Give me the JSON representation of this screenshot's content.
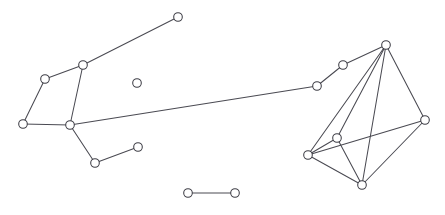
{
  "canvas": {
    "width": 445,
    "height": 215,
    "background": "#ffffff"
  },
  "style": {
    "edge_color": "#4a4a52",
    "edge_width": 1.05,
    "node_fill": "#ffffff",
    "node_stroke": "#3c3c44",
    "node_stroke_width": 1.05,
    "node_radius": 4.3
  },
  "chart_data": {
    "type": "scatter",
    "title": "",
    "subtitle": "",
    "xlabel": "",
    "ylabel": "",
    "grid": false,
    "legend": "none",
    "axes_visible": false,
    "tick_labels": [],
    "annotations": [],
    "xlim": [
      0,
      445
    ],
    "ylim": [
      0,
      215
    ],
    "node_count": 17,
    "edge_count": 26,
    "component_count": 3,
    "nodes": [
      {
        "id": "n0",
        "label": "",
        "x": 178,
        "y": 17,
        "degree": 1,
        "group": "left-cluster"
      },
      {
        "id": "n1",
        "label": "",
        "x": 83,
        "y": 65,
        "degree": 3,
        "group": "left-cluster"
      },
      {
        "id": "n2",
        "label": "",
        "x": 45,
        "y": 79,
        "degree": 2,
        "group": "left-cluster"
      },
      {
        "id": "n3",
        "label": "",
        "x": 23,
        "y": 124,
        "degree": 2,
        "group": "left-cluster"
      },
      {
        "id": "n4",
        "label": "",
        "x": 70,
        "y": 125,
        "degree": 4,
        "group": "left-cluster"
      },
      {
        "id": "n5",
        "label": "",
        "x": 95,
        "y": 163,
        "degree": 2,
        "group": "left-cluster"
      },
      {
        "id": "n6",
        "label": "",
        "x": 138,
        "y": 147,
        "degree": 1,
        "group": "left-cluster"
      },
      {
        "id": "n7",
        "label": "",
        "x": 317,
        "y": 86,
        "degree": 2,
        "group": "bridge"
      },
      {
        "id": "n8",
        "label": "",
        "x": 343,
        "y": 65,
        "degree": 2,
        "group": "bridge"
      },
      {
        "id": "n9",
        "label": "",
        "x": 386,
        "y": 45,
        "degree": 5,
        "group": "right-cluster"
      },
      {
        "id": "n10",
        "label": "",
        "x": 425,
        "y": 120,
        "degree": 4,
        "group": "right-cluster"
      },
      {
        "id": "n11",
        "label": "",
        "x": 337,
        "y": 138,
        "degree": 4,
        "group": "right-cluster"
      },
      {
        "id": "n12",
        "label": "",
        "x": 308,
        "y": 155,
        "degree": 4,
        "group": "right-cluster"
      },
      {
        "id": "n13",
        "label": "",
        "x": 362,
        "y": 185,
        "degree": 4,
        "group": "right-cluster"
      },
      {
        "id": "n14",
        "label": "",
        "x": 137,
        "y": 83,
        "degree": 0,
        "group": "isolated-node"
      },
      {
        "id": "n15",
        "label": "",
        "x": 188,
        "y": 193,
        "degree": 1,
        "group": "isolated-pair"
      },
      {
        "id": "n16",
        "label": "",
        "x": 235,
        "y": 193,
        "degree": 1,
        "group": "isolated-pair"
      }
    ],
    "edges": [
      {
        "source": "n0",
        "target": "n1"
      },
      {
        "source": "n1",
        "target": "n2"
      },
      {
        "source": "n1",
        "target": "n4"
      },
      {
        "source": "n2",
        "target": "n3"
      },
      {
        "source": "n3",
        "target": "n4"
      },
      {
        "source": "n4",
        "target": "n5"
      },
      {
        "source": "n4",
        "target": "n7"
      },
      {
        "source": "n5",
        "target": "n6"
      },
      {
        "source": "n7",
        "target": "n8"
      },
      {
        "source": "n8",
        "target": "n9"
      },
      {
        "source": "n9",
        "target": "n10"
      },
      {
        "source": "n9",
        "target": "n11"
      },
      {
        "source": "n9",
        "target": "n12"
      },
      {
        "source": "n9",
        "target": "n13"
      },
      {
        "source": "n10",
        "target": "n12"
      },
      {
        "source": "n10",
        "target": "n13"
      },
      {
        "source": "n11",
        "target": "n12"
      },
      {
        "source": "n11",
        "target": "n13"
      },
      {
        "source": "n12",
        "target": "n13"
      },
      {
        "source": "n15",
        "target": "n16"
      }
    ]
  }
}
